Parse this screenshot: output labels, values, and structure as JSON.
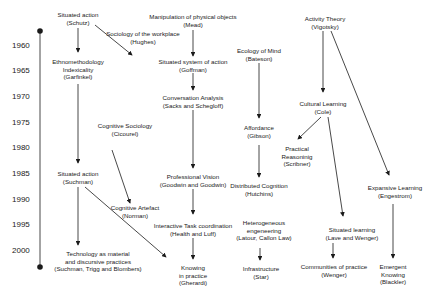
{
  "timeline": {
    "years": [
      "1960",
      "1965",
      "1970",
      "1975",
      "1980",
      "1985",
      "1990",
      "1995",
      "2000"
    ]
  },
  "nodes": {
    "schutz": {
      "title": "Situated action",
      "author": "(Schutz)"
    },
    "mead": {
      "title": "Manipulation of physical objects",
      "author": "(Mead)"
    },
    "hughes": {
      "title": "Sociology of the workplace",
      "author": "(Hughes)"
    },
    "vigotsky": {
      "title": "Activity Theory",
      "author": "(Vigotsky)"
    },
    "garfinkel": {
      "title": "Ethnomethodology",
      "title2": "Indexicality",
      "author": "(Garfinkel)"
    },
    "goffman": {
      "title": "Situated system of action",
      "author": "(Goffman)"
    },
    "bateson": {
      "title": "Ecology of Mind",
      "author": "(Bateson)"
    },
    "sacks": {
      "title": "Conversation Analysis",
      "author": "(Sacks and Schegloff)"
    },
    "cole": {
      "title": "Cultural Learning",
      "author": "(Cole)"
    },
    "cicourel": {
      "title": "Cognitive Sociology",
      "author": "(Cicourel)"
    },
    "gibson": {
      "title": "Affordance",
      "author": "(Gibson)"
    },
    "scribner": {
      "title": "Practical",
      "title2": "Reasoninig",
      "author": "(Scribner)"
    },
    "suchman": {
      "title": "Situated action",
      "author": "(Suchman)"
    },
    "goodwin": {
      "title": "Professional Vision",
      "author": "(Goodwin and Goodwin)"
    },
    "hutchins": {
      "title": "Distributed Cognition",
      "author": "(Hutchins)"
    },
    "engestrom": {
      "title": "Expansive Learning",
      "author": "(Engestrom)"
    },
    "norman": {
      "title": "Cognitive Artefact",
      "author": "(Norman)"
    },
    "heath": {
      "title": "Interactive Task coordination",
      "author": "(Health and Luff)"
    },
    "latour": {
      "title": "Heterogeneous",
      "title2": "engeneering",
      "author": "(Latour, Callon Law)"
    },
    "lave": {
      "title": "Situated learning",
      "author": "(Lave and Wenger)"
    },
    "suchman2": {
      "title": "Technology as material",
      "title2": "and discursive practices",
      "author": "(Suchman, Trigg and Blombers)"
    },
    "gherardi": {
      "title": "Knowing",
      "title2": "in practice",
      "author": "(Gherardi)"
    },
    "star": {
      "title": "Infrastructure",
      "author": "(Star)"
    },
    "wenger": {
      "title": "Communities of practice",
      "author": "(Wenger)"
    },
    "blackler": {
      "title": "Emergent",
      "title2": "Knowing",
      "author": "(Blackler)"
    }
  },
  "colors": {
    "ink": "#1a1a1a",
    "background": "#ffffff"
  }
}
